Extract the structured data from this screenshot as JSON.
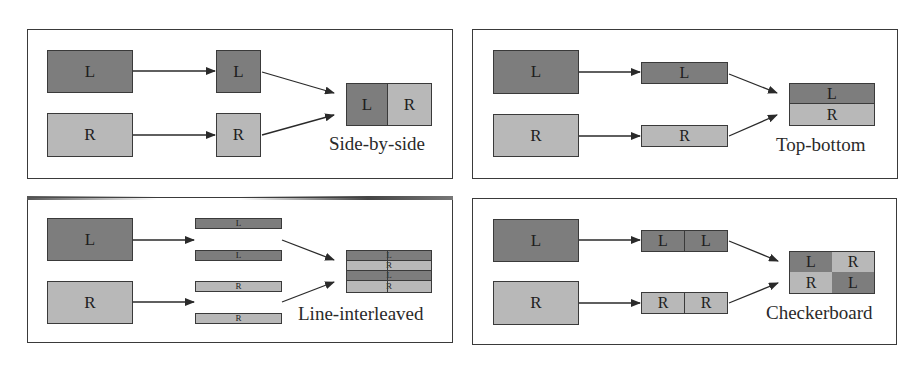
{
  "colors": {
    "left_view": "#7d7d7d",
    "right_view": "#b8b8b8",
    "border": "#3a3a3a"
  },
  "panels": [
    {
      "name": "side-by-side",
      "caption": "Side-by-side",
      "inputs": [
        "L",
        "R"
      ],
      "intermediate": [
        "L",
        "R"
      ],
      "output": [
        "L",
        "R"
      ]
    },
    {
      "name": "top-bottom",
      "caption": "Top-bottom",
      "inputs": [
        "L",
        "R"
      ],
      "intermediate": [
        "L",
        "R"
      ],
      "output": [
        "L",
        "R"
      ]
    },
    {
      "name": "line-interleaved",
      "caption": "Line-interleaved",
      "inputs": [
        "L",
        "R"
      ],
      "intermediate": [
        "L",
        "L",
        "R",
        "R"
      ],
      "output": [
        "L",
        "R",
        "L",
        "R"
      ]
    },
    {
      "name": "checkerboard",
      "caption": "Checkerboard",
      "inputs": [
        "L",
        "R"
      ],
      "intermediate": [
        "L",
        "L",
        "R",
        "R"
      ],
      "output": [
        "L",
        "R",
        "R",
        "L"
      ]
    }
  ]
}
